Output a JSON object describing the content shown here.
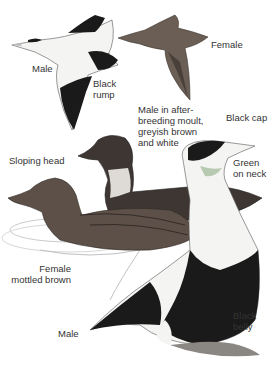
{
  "illustration": {
    "subject": "Eider ducks",
    "colors": {
      "background": "#ffffff",
      "label_text": "#333333",
      "male_black": "#1a1a1a",
      "male_white": "#f4f4f2",
      "female_brown": "#5c5048",
      "water": "#c9cbcc"
    }
  },
  "labels": {
    "male_flight": "Male",
    "black_rump": "Black\nrump",
    "female_flight": "Female",
    "male_moult": "Male in after-\nbreeding moult,\ngreyish brown\nand white",
    "black_cap": "Black cap",
    "sloping_head": "Sloping head",
    "green_on_neck": "Green\non neck",
    "female_mottled": "Female\nmottled brown",
    "male_swimming": "Male",
    "black_belly": "Black\nbelly"
  }
}
